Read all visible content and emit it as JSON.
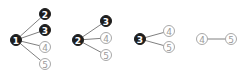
{
  "diagram": {
    "type": "tree-sequence",
    "radius": 5.5,
    "colors": {
      "filled": "#1e1e1e",
      "open_stroke": "#a8a8a8",
      "edge": "#808080"
    },
    "groups": [
      {
        "root": {
          "label": "1",
          "x": 16,
          "y": 40,
          "filled": true
        },
        "children": [
          {
            "label": "2",
            "x": 45,
            "y": 14,
            "filled": true
          },
          {
            "label": "3",
            "x": 45,
            "y": 30,
            "filled": true
          },
          {
            "label": "4",
            "x": 45,
            "y": 47,
            "filled": false
          },
          {
            "label": "5",
            "x": 45,
            "y": 64,
            "filled": false
          }
        ]
      },
      {
        "root": {
          "label": "2",
          "x": 78,
          "y": 40,
          "filled": true
        },
        "children": [
          {
            "label": "3",
            "x": 106,
            "y": 21,
            "filled": true
          },
          {
            "label": "4",
            "x": 106,
            "y": 38,
            "filled": false
          },
          {
            "label": "5",
            "x": 106,
            "y": 55,
            "filled": false
          }
        ]
      },
      {
        "root": {
          "label": "3",
          "x": 140,
          "y": 39,
          "filled": true
        },
        "children": [
          {
            "label": "4",
            "x": 169,
            "y": 31,
            "filled": false
          },
          {
            "label": "5",
            "x": 169,
            "y": 47,
            "filled": false
          }
        ]
      },
      {
        "root": {
          "label": "4",
          "x": 202,
          "y": 39,
          "filled": false
        },
        "children": [
          {
            "label": "5",
            "x": 231,
            "y": 39,
            "filled": false
          }
        ]
      }
    ]
  }
}
